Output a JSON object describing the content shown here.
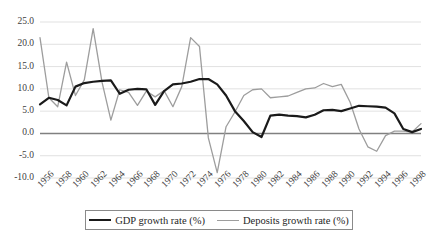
{
  "chart_data": {
    "type": "line",
    "title": "",
    "xlabel": "",
    "ylabel": "",
    "grid": true,
    "legend_position": "bottom",
    "ylim": [
      -10.0,
      25.0
    ],
    "xlim": [
      1956,
      1999
    ],
    "ytick_labels": [
      "25.0",
      "20.0",
      "15.0",
      "10.0",
      "5.0",
      "0.0",
      "-5.0",
      "-10.0"
    ],
    "ytick_values": [
      25.0,
      20.0,
      15.0,
      10.0,
      5.0,
      0.0,
      -5.0,
      -10.0
    ],
    "xtick_labels": [
      "1956",
      "1958",
      "1960",
      "1962",
      "1964",
      "1966",
      "1968",
      "1970",
      "1972",
      "1974",
      "1976",
      "1978",
      "1980",
      "1982",
      "1984",
      "1986",
      "1988",
      "1990",
      "1992",
      "1994",
      "1996",
      "1998"
    ],
    "x": [
      1956,
      1957,
      1958,
      1959,
      1960,
      1961,
      1962,
      1963,
      1964,
      1965,
      1966,
      1967,
      1968,
      1969,
      1970,
      1971,
      1972,
      1973,
      1974,
      1975,
      1976,
      1977,
      1978,
      1979,
      1980,
      1981,
      1982,
      1983,
      1984,
      1985,
      1986,
      1987,
      1988,
      1989,
      1990,
      1991,
      1992,
      1993,
      1994,
      1995,
      1996,
      1997,
      1998,
      1999
    ],
    "series": [
      {
        "name": "GDP growth rate (%)",
        "color": "#1a1a1a",
        "width": 2.2,
        "values": [
          6.5,
          8.0,
          7.5,
          6.3,
          10.5,
          11.3,
          11.6,
          11.8,
          11.9,
          8.9,
          9.8,
          10.0,
          9.9,
          6.4,
          9.5,
          11.0,
          11.2,
          11.6,
          12.2,
          12.2,
          11.0,
          8.5,
          5.0,
          2.8,
          0.3,
          -0.8,
          4.0,
          4.2,
          4.0,
          3.9,
          3.6,
          4.2,
          5.2,
          5.3,
          5.0,
          5.6,
          6.2,
          6.1,
          6.0,
          5.8,
          4.5,
          1.0,
          0.3,
          1.0
        ]
      },
      {
        "name": "Deposits growth rate (%)",
        "color": "#9d9d9d",
        "width": 1.3,
        "values": [
          21.5,
          8.0,
          6.0,
          16.0,
          8.5,
          12.0,
          23.5,
          11.5,
          3.0,
          9.8,
          9.2,
          6.3,
          9.5,
          8.2,
          9.6,
          6.0,
          10.5,
          21.5,
          19.5,
          -1.0,
          -8.8,
          1.5,
          4.8,
          8.5,
          9.8,
          10.0,
          8.0,
          8.2,
          8.4,
          9.2,
          10.0,
          10.2,
          11.2,
          10.5,
          11.0,
          7.0,
          1.0,
          -3.0,
          -4.0,
          -0.5,
          0.5,
          0.5,
          0.3,
          2.2
        ]
      }
    ]
  },
  "legend": {
    "entries": [
      {
        "label": "GDP growth rate (%)"
      },
      {
        "label": "Deposits growth rate (%)"
      }
    ]
  }
}
